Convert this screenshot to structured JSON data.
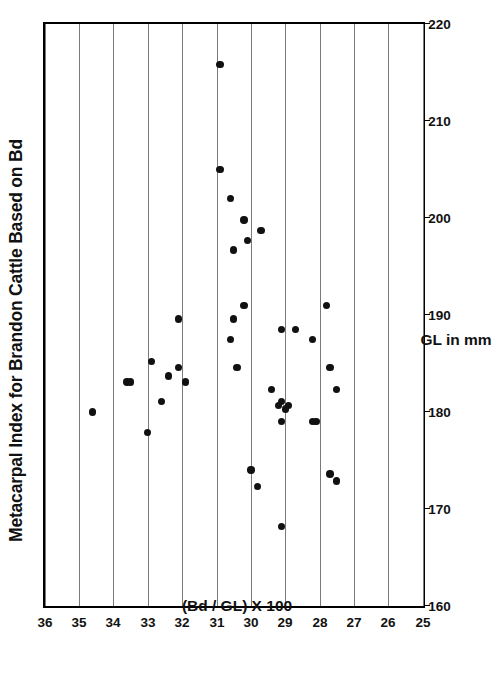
{
  "chart_data": {
    "type": "scatter",
    "title": "Metacarpal Index for Brandon Cattle Based on Bd",
    "orientation": "rotated-90-ccw",
    "xlabel": "GL in mm",
    "ylabel": "(Bd / GL) X 100",
    "xlim": [
      160,
      220
    ],
    "ylim": [
      25,
      36
    ],
    "y_axis_direction": "descending-top-to-bottom",
    "xticks": [
      160,
      170,
      180,
      190,
      200,
      210,
      220
    ],
    "xticklabels": [
      "160",
      "170",
      "180",
      "190",
      "200",
      "210",
      "220"
    ],
    "yticks": [
      36,
      35,
      34,
      33,
      32,
      31,
      30,
      29,
      28,
      27,
      26,
      25
    ],
    "yticklabels": [
      "36",
      "35",
      "34",
      "33",
      "32",
      "31",
      "30",
      "29",
      "28",
      "27",
      "26",
      "25"
    ],
    "grid": "vertical-gridlines-on-y-ticks",
    "legend": null,
    "marker": "filled-circle",
    "marker_color": "#111111",
    "n_points": 40,
    "points": [
      {
        "gl": 215.8,
        "index": 30.9
      },
      {
        "gl": 205.0,
        "index": 30.9
      },
      {
        "gl": 202.0,
        "index": 30.6
      },
      {
        "gl": 199.8,
        "index": 30.2
      },
      {
        "gl": 198.7,
        "index": 29.7
      },
      {
        "gl": 197.7,
        "index": 30.1
      },
      {
        "gl": 196.7,
        "index": 30.5
      },
      {
        "gl": 191.0,
        "index": 30.2
      },
      {
        "gl": 191.0,
        "index": 27.8
      },
      {
        "gl": 189.6,
        "index": 32.1
      },
      {
        "gl": 189.6,
        "index": 30.5
      },
      {
        "gl": 188.5,
        "index": 29.1
      },
      {
        "gl": 188.5,
        "index": 28.7
      },
      {
        "gl": 187.5,
        "index": 30.6
      },
      {
        "gl": 187.5,
        "index": 28.2
      },
      {
        "gl": 185.2,
        "index": 32.9
      },
      {
        "gl": 184.6,
        "index": 32.1
      },
      {
        "gl": 184.6,
        "index": 30.4
      },
      {
        "gl": 184.6,
        "index": 27.7
      },
      {
        "gl": 183.7,
        "index": 32.4
      },
      {
        "gl": 183.1,
        "index": 33.6
      },
      {
        "gl": 183.1,
        "index": 33.5
      },
      {
        "gl": 183.1,
        "index": 31.9
      },
      {
        "gl": 182.3,
        "index": 29.4
      },
      {
        "gl": 182.3,
        "index": 27.5
      },
      {
        "gl": 181.1,
        "index": 32.6
      },
      {
        "gl": 181.1,
        "index": 29.1
      },
      {
        "gl": 180.7,
        "index": 29.2
      },
      {
        "gl": 180.7,
        "index": 28.9
      },
      {
        "gl": 180.3,
        "index": 29.0
      },
      {
        "gl": 180.0,
        "index": 34.6
      },
      {
        "gl": 179.0,
        "index": 29.1
      },
      {
        "gl": 179.0,
        "index": 28.2
      },
      {
        "gl": 179.0,
        "index": 28.1
      },
      {
        "gl": 177.9,
        "index": 33.0
      },
      {
        "gl": 174.0,
        "index": 30.0
      },
      {
        "gl": 173.6,
        "index": 27.7
      },
      {
        "gl": 172.9,
        "index": 27.5
      },
      {
        "gl": 172.3,
        "index": 29.8
      },
      {
        "gl": 168.2,
        "index": 29.1
      }
    ]
  }
}
